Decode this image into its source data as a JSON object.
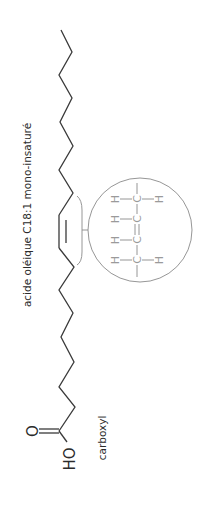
{
  "figure": {
    "type": "chemical-structure",
    "orientation": "rotated-90",
    "title": "acide oléique  C18:1 mono-insaturé",
    "carboxyl_label": "carboxyl",
    "hydroxyl_label": "HO",
    "carbonyl_oxygen": "O",
    "colors": {
      "chain": "#3a3a3a",
      "detail": "#8a8a8a",
      "text": "#2b2b2b"
    }
  },
  "inset": {
    "description": "magnified cis double bond",
    "rows": [
      {
        "left": "H",
        "center": "C",
        "right": "H"
      },
      {
        "left": "H",
        "center": "C",
        "right": ""
      },
      {
        "left": "H",
        "center": "C",
        "right": ""
      },
      {
        "left": "H",
        "center": "C",
        "right": "H"
      }
    ],
    "double_bond_between": [
      1,
      2
    ]
  }
}
